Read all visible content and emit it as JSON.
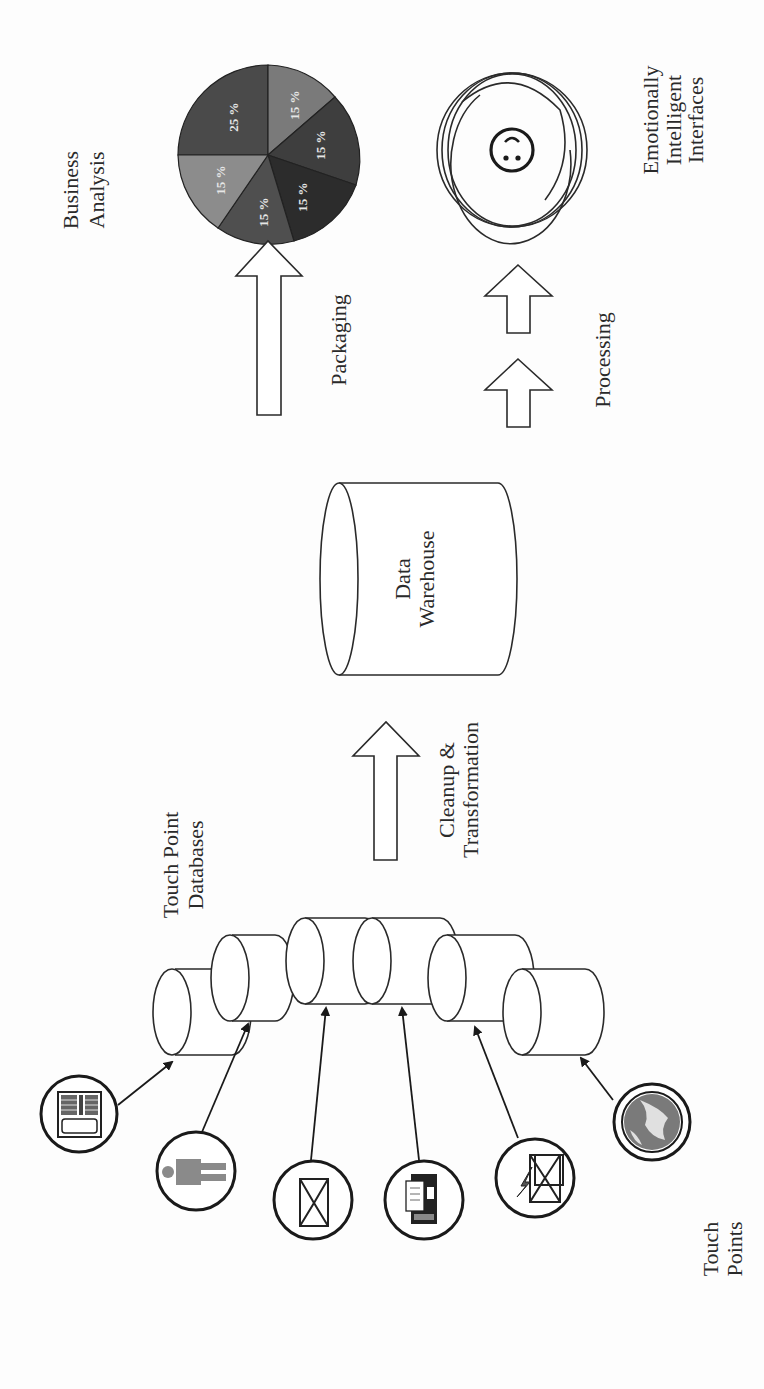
{
  "labels": {
    "business_analysis": [
      "Business",
      "Analysis"
    ],
    "emotionally_intelligent": [
      "Emotionally",
      "Intelligent",
      "Interfaces"
    ],
    "packaging": "Packaging",
    "processing": "Processing",
    "data_warehouse": [
      "Data",
      "Warehouse"
    ],
    "cleanup": [
      "Cleanup &",
      "Transformation"
    ],
    "touch_point_databases": [
      "Touch Point",
      "Databases"
    ],
    "touch_points": [
      "Touch",
      "Points"
    ]
  },
  "pie": {
    "slices": [
      {
        "label": "25 %",
        "value": 25,
        "color": "#4a4a4a"
      },
      {
        "label": "15 %",
        "value": 15,
        "color": "#7a7a7a"
      },
      {
        "label": "15 %",
        "value": 15,
        "color": "#3e3e3e"
      },
      {
        "label": "15 %",
        "value": 15,
        "color": "#2c2c2c"
      },
      {
        "label": "15 %",
        "value": 15,
        "color": "#4f4f4f"
      },
      {
        "label": "15 %",
        "value": 15,
        "color": "#8c8c8c"
      }
    ]
  },
  "touch_points": [
    {
      "name": "keypad-device",
      "icon": "calculator-icon"
    },
    {
      "name": "person",
      "icon": "person-icon"
    },
    {
      "name": "mail",
      "icon": "envelope-icon"
    },
    {
      "name": "fax",
      "icon": "fax-icon"
    },
    {
      "name": "email",
      "icon": "email-lightning-icon"
    },
    {
      "name": "web",
      "icon": "globe-icon"
    }
  ],
  "colors": {
    "stroke": "#2a2a2a",
    "background": "#fdfdfd",
    "pie_text": "#e6e6e6"
  }
}
